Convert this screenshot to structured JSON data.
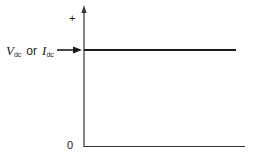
{
  "diagram": {
    "title": "",
    "axis": {
      "y_top_label": "+",
      "origin_label": "0"
    },
    "signal_label": {
      "v_symbol": "V",
      "v_subscript": "dc",
      "connector": "or",
      "i_symbol": "I",
      "i_subscript": "dc"
    },
    "line_color": "#1a1a1a"
  }
}
